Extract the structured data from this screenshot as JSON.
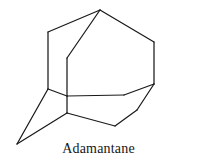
{
  "figure": {
    "caption": "Adamantane",
    "background_color": "#ffffff",
    "line_color": "#1a1a1a",
    "line_width": 1.25,
    "width": 197,
    "height": 164
  },
  "chart_data": {
    "type": "diagram",
    "title": "Adamantane",
    "subtitle": "",
    "xlabel": "",
    "ylabel": "",
    "render_mode": "wireframe-skeletal",
    "viewbox": [
      0,
      0,
      197,
      164
    ],
    "vertices": [
      {
        "id": "v_apex",
        "label": "top-apex",
        "x": 100,
        "y": 10
      },
      {
        "id": "v_up_left",
        "label": "upper-left",
        "x": 48,
        "y": 32
      },
      {
        "id": "v_up_right",
        "label": "upper-right",
        "x": 154,
        "y": 42
      },
      {
        "id": "v_front_top",
        "label": "front-upper-center",
        "x": 67,
        "y": 58
      },
      {
        "id": "v_right_mid",
        "label": "right-middle",
        "x": 154,
        "y": 84
      },
      {
        "id": "v_left_mid",
        "label": "left-middle",
        "x": 48,
        "y": 89
      },
      {
        "id": "v_front_cross",
        "label": "front-center-cross",
        "x": 67,
        "y": 96
      },
      {
        "id": "v_mid_right",
        "label": "middle-right-bend",
        "x": 124,
        "y": 95
      },
      {
        "id": "v_front_low",
        "label": "front-lower-center",
        "x": 67,
        "y": 113
      },
      {
        "id": "v_low_right",
        "label": "lower-right-bend",
        "x": 137,
        "y": 110
      },
      {
        "id": "v_bottom_mid",
        "label": "bottom-center",
        "x": 115,
        "y": 126
      },
      {
        "id": "v_bottom_left",
        "label": "bottom-left-apex",
        "x": 17,
        "y": 144
      }
    ],
    "edges": [
      {
        "from": "v_apex",
        "to": "v_up_left"
      },
      {
        "from": "v_apex",
        "to": "v_up_right"
      },
      {
        "from": "v_apex",
        "to": "v_front_top"
      },
      {
        "from": "v_up_left",
        "to": "v_left_mid"
      },
      {
        "from": "v_up_right",
        "to": "v_right_mid"
      },
      {
        "from": "v_front_top",
        "to": "v_front_cross"
      },
      {
        "from": "v_left_mid",
        "to": "v_front_cross"
      },
      {
        "from": "v_front_cross",
        "to": "v_mid_right"
      },
      {
        "from": "v_mid_right",
        "to": "v_right_mid"
      },
      {
        "from": "v_front_cross",
        "to": "v_front_low"
      },
      {
        "from": "v_left_mid",
        "to": "v_bottom_left"
      },
      {
        "from": "v_bottom_left",
        "to": "v_front_low"
      },
      {
        "from": "v_front_low",
        "to": "v_bottom_mid"
      },
      {
        "from": "v_bottom_mid",
        "to": "v_low_right"
      },
      {
        "from": "v_low_right",
        "to": "v_right_mid"
      }
    ]
  }
}
